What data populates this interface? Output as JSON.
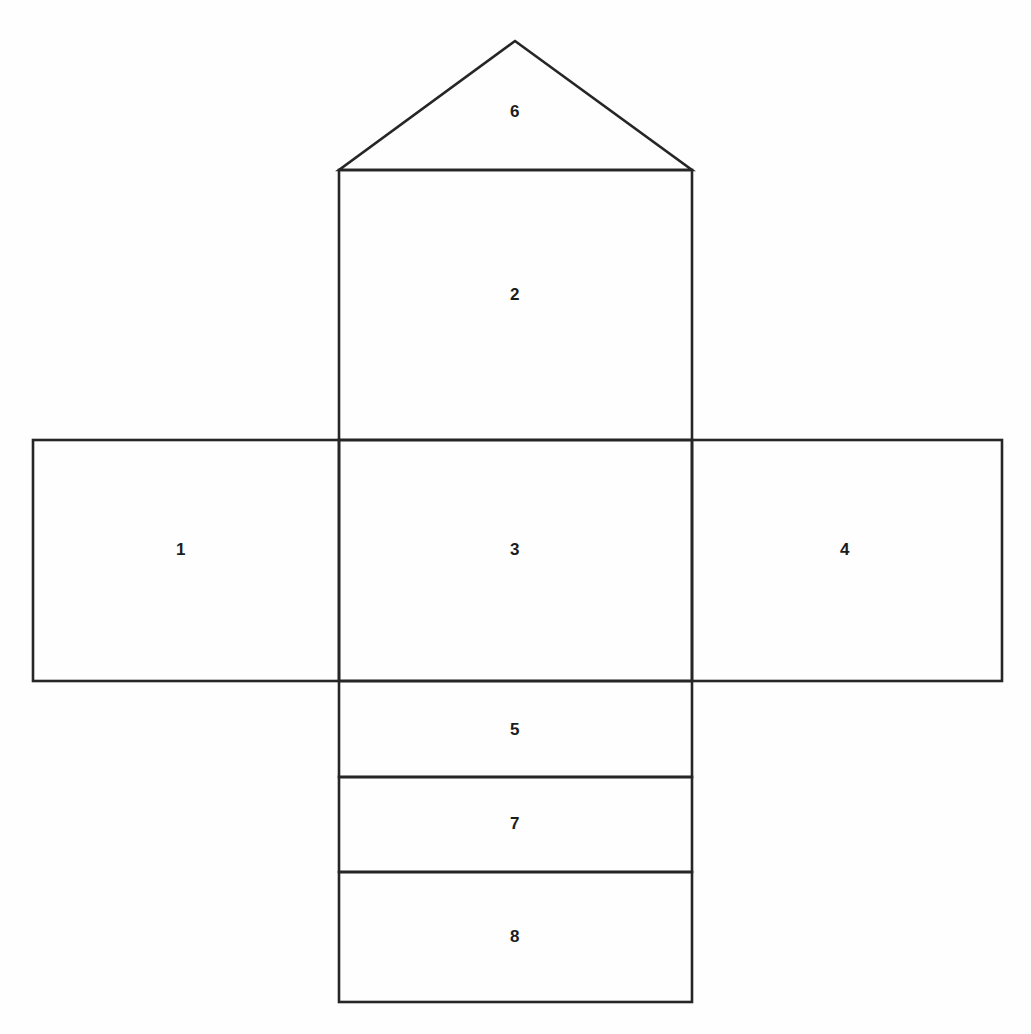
{
  "page": {
    "background_color": "#fefefe",
    "stroke_color": "#262626",
    "label_color": "#1c1c1c",
    "width": 1031,
    "height": 1034
  },
  "header": {
    "clipped_text": "cropped page heading (illegible — only descenders visible)"
  },
  "diagram": {
    "type": "net-of-solid",
    "faces": [
      {
        "id": "face-1",
        "label": "1",
        "shape": "rectangle",
        "label_x": 181,
        "label_y": 550,
        "rect": {
          "x": 33,
          "y": 440,
          "w": 306,
          "h": 241
        }
      },
      {
        "id": "face-2",
        "label": "2",
        "shape": "rectangle",
        "label_x": 515,
        "label_y": 295,
        "rect": {
          "x": 339,
          "y": 170,
          "w": 353,
          "h": 270
        }
      },
      {
        "id": "face-3",
        "label": "3",
        "shape": "rectangle",
        "label_x": 515,
        "label_y": 550,
        "rect": {
          "x": 339,
          "y": 440,
          "w": 353,
          "h": 241
        }
      },
      {
        "id": "face-4",
        "label": "4",
        "shape": "rectangle",
        "label_x": 845,
        "label_y": 550,
        "rect": {
          "x": 692,
          "y": 440,
          "w": 310,
          "h": 241
        }
      },
      {
        "id": "face-5",
        "label": "5",
        "shape": "rectangle",
        "label_x": 515,
        "label_y": 730,
        "rect": {
          "x": 339,
          "y": 681,
          "w": 353,
          "h": 96
        }
      },
      {
        "id": "face-6",
        "label": "6",
        "shape": "triangle",
        "label_x": 515,
        "label_y": 112,
        "points": "515,41 692,170 339,170"
      },
      {
        "id": "face-7",
        "label": "7",
        "shape": "rectangle",
        "label_x": 515,
        "label_y": 824,
        "rect": {
          "x": 339,
          "y": 777,
          "w": 353,
          "h": 95
        }
      },
      {
        "id": "face-8",
        "label": "8",
        "shape": "rectangle",
        "label_x": 515,
        "label_y": 937,
        "rect": {
          "x": 339,
          "y": 872,
          "w": 353,
          "h": 130
        }
      }
    ]
  }
}
